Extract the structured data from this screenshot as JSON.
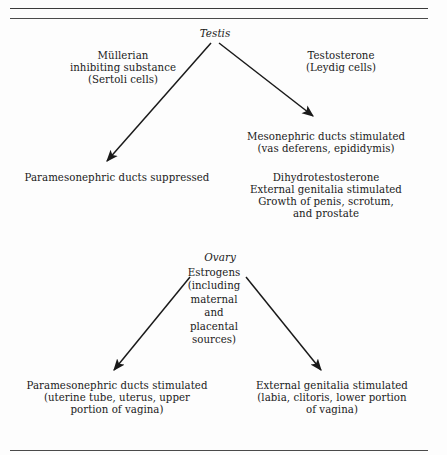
{
  "figure": {
    "background_color": "#fdfdfd",
    "line_color": "#1a1a1a",
    "rule_color": "#3a3a3a"
  },
  "male_pathway": {
    "gonad": "Testis",
    "left_branch": {
      "hormone": "Müllerian\ninhibiting substance\n(Sertoli cells)",
      "effect": "Paramesonephric ducts suppressed"
    },
    "right_branch": {
      "hormone": "Testosterone\n(Leydig cells)",
      "effect": "Mesonephric ducts stimulated\n(vas deferens, epididymis)",
      "secondary_effect": "Dihydrotestosterone\nExternal genitalia stimulated\nGrowth of penis, scrotum,\nand prostate"
    }
  },
  "female_pathway": {
    "gonad": "Ovary",
    "hormone": "Estrogens\n(including\nmaternal\nand\nplacental\nsources)",
    "left_effect": "Paramesonephric ducts stimulated\n(uterine tube, uterus, upper\nportion of vagina)",
    "right_effect": "External genitalia stimulated\n(labia, clitoris, lower portion\nof vagina)"
  }
}
